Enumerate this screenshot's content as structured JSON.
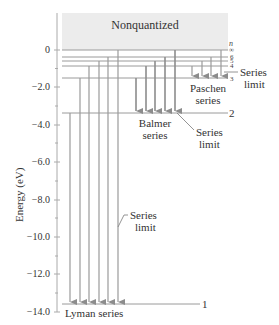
{
  "diagram": {
    "title_region": "Nonquantized",
    "y_axis": {
      "label": "Energy (eV)",
      "ticks": [
        "0",
        "−2.0",
        "−4.0",
        "−6.0",
        "−8.0",
        "−10.0",
        "−12.0",
        "−14.0"
      ]
    },
    "levels": [
      {
        "n": "∞",
        "energy": 0
      },
      {
        "n": "6",
        "energy": -0.38
      },
      {
        "n": "5",
        "energy": -0.54
      },
      {
        "n": "4",
        "energy": -0.85
      },
      {
        "n": "3",
        "energy": -1.51
      },
      {
        "n": "2",
        "energy": -3.4
      },
      {
        "n": "1",
        "energy": -13.6
      }
    ],
    "n_header": "n",
    "n_labels": {
      "inf": "∞",
      "n6": "6",
      "n5": "5",
      "n4": "4",
      "n3": "3",
      "n2": "2",
      "n1": "1"
    },
    "series": {
      "lyman": {
        "label": "Lyman series",
        "limit_label_1": "Series",
        "limit_label_2": "limit"
      },
      "balmer": {
        "label_1": "Balmer",
        "label_2": "series",
        "limit_label_1": "Series",
        "limit_label_2": "limit"
      },
      "paschen": {
        "label_1": "Paschen",
        "label_2": "series",
        "limit_label_1": "Series",
        "limit_label_2": "limit"
      }
    },
    "colors": {
      "nonquantized_bg": "#ececec",
      "lines": "#9a9a9a",
      "arrows": "#8c8c8c",
      "text": "#333333"
    }
  }
}
